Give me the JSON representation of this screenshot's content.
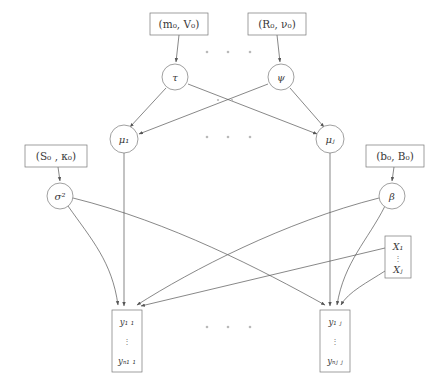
{
  "diagram": {
    "colors": {
      "edge": "#555555",
      "node_stroke": "#777777",
      "text": "#3a3a3a",
      "dots": "#b9b9b9",
      "background": "#ffffff"
    },
    "hyperparameter_boxes": [
      {
        "id": "mV0",
        "label": "(m₀, V₀)",
        "x": 150,
        "y": 13,
        "w": 58,
        "h": 22
      },
      {
        "id": "Rnu0",
        "label": "(R₀, ν₀)",
        "x": 248,
        "y": 13,
        "w": 58,
        "h": 22
      },
      {
        "id": "Sk0",
        "label": "(S₀ , κ₀)",
        "x": 25,
        "y": 145,
        "w": 62,
        "h": 22
      },
      {
        "id": "bB0",
        "label": "(b₀, B₀)",
        "x": 366,
        "y": 145,
        "w": 58,
        "h": 22
      }
    ],
    "circle_nodes": [
      {
        "id": "tau",
        "label": "τ",
        "cx": 175,
        "cy": 77,
        "r": 13
      },
      {
        "id": "psi",
        "label": "ψ",
        "cx": 281,
        "cy": 77,
        "r": 13
      },
      {
        "id": "mu1",
        "label": "μ₁",
        "cx": 124,
        "cy": 139,
        "r": 14
      },
      {
        "id": "muJ",
        "label": "μⱼ",
        "cx": 330,
        "cy": 139,
        "r": 14
      },
      {
        "id": "sig2",
        "label": "σ²",
        "cx": 60,
        "cy": 196,
        "r": 13
      },
      {
        "id": "beta",
        "label": "β",
        "cx": 392,
        "cy": 196,
        "r": 13
      }
    ],
    "covariate_box": {
      "id": "Xbox",
      "top_label": "X₁",
      "bottom_label": "Xⱼ",
      "x": 385,
      "y": 236,
      "w": 26,
      "h": 42
    },
    "observation_boxes": [
      {
        "id": "y1",
        "top_label": "y₁ ₁",
        "bottom_label": "yₙ₁ ₁",
        "x": 112,
        "y": 310,
        "w": 30,
        "h": 62
      },
      {
        "id": "yJ",
        "top_label": "y₁ ⱼ",
        "bottom_label": "yₙⱼ ⱼ",
        "x": 320,
        "y": 310,
        "w": 30,
        "h": 62
      }
    ],
    "ellipsis_rows": [
      {
        "id": "dots-top",
        "y": 52,
        "xs": [
          207,
          228,
          250
        ]
      },
      {
        "id": "dots-mid",
        "y": 100,
        "xs": [
          207,
          228,
          250
        ]
      },
      {
        "id": "dots-mu",
        "y": 137,
        "xs": [
          207,
          228,
          250
        ]
      },
      {
        "id": "dots-bottom",
        "y": 327,
        "xs": [
          207,
          228,
          250
        ]
      }
    ],
    "edges": [
      {
        "id": "mV0-to-tau",
        "from": "mV0",
        "to": "tau",
        "type": "straight",
        "arrow": true
      },
      {
        "id": "Rnu0-to-psi",
        "from": "Rnu0",
        "to": "psi",
        "type": "straight",
        "arrow": true
      },
      {
        "id": "Sk0-to-sig2",
        "from": "Sk0",
        "to": "sig2",
        "type": "straight",
        "arrow": true
      },
      {
        "id": "bB0-to-beta",
        "from": "bB0",
        "to": "beta",
        "type": "straight",
        "arrow": true
      },
      {
        "id": "tau-to-mu1",
        "from": "tau",
        "to": "mu1",
        "type": "straight",
        "arrow": true
      },
      {
        "id": "tau-to-muJ",
        "from": "tau",
        "to": "muJ",
        "type": "straight",
        "arrow": true
      },
      {
        "id": "psi-to-mu1",
        "from": "psi",
        "to": "mu1",
        "type": "straight",
        "arrow": true
      },
      {
        "id": "psi-to-muJ",
        "from": "psi",
        "to": "muJ",
        "type": "straight",
        "arrow": true
      },
      {
        "id": "mu1-to-y1",
        "from": "mu1",
        "to": "y1",
        "type": "straight",
        "arrow": true
      },
      {
        "id": "muJ-to-yJ",
        "from": "muJ",
        "to": "yJ",
        "type": "straight",
        "arrow": true
      },
      {
        "id": "sig2-to-y1",
        "from": "sig2",
        "to": "y1",
        "type": "curved",
        "arrow": true
      },
      {
        "id": "sig2-to-yJ",
        "from": "sig2",
        "to": "yJ",
        "type": "curved",
        "arrow": true
      },
      {
        "id": "beta-to-y1",
        "from": "beta",
        "to": "y1",
        "type": "curved",
        "arrow": true
      },
      {
        "id": "beta-to-yJ",
        "from": "beta",
        "to": "yJ",
        "type": "curved",
        "arrow": true
      },
      {
        "id": "X1-to-y1",
        "from": "Xbox",
        "to": "y1",
        "type": "curved",
        "arrow": true
      },
      {
        "id": "XJ-to-yJ",
        "from": "Xbox",
        "to": "yJ",
        "type": "curved",
        "arrow": true
      }
    ]
  }
}
